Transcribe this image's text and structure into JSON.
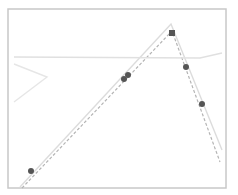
{
  "chart_data": {
    "type": "line",
    "title": "",
    "xlabel": "",
    "ylabel": "",
    "grid": false,
    "legend": null,
    "frame": {
      "x0": 8,
      "y0": 9,
      "x1": 226,
      "y1": 188,
      "color": "#c8c8c8"
    },
    "series": [
      {
        "name": "solid-path",
        "style": "solid",
        "color": "#dcdcdc",
        "points": [
          [
            20,
            187
          ],
          [
            171,
            24
          ],
          [
            222,
            150
          ]
        ]
      },
      {
        "name": "dashed-path",
        "style": "dashed",
        "color": "#b4b4b4",
        "points": [
          [
            22,
            188
          ],
          [
            172,
            31
          ],
          [
            220,
            162
          ]
        ]
      },
      {
        "name": "horizontal-line",
        "style": "solid",
        "color": "#e0e0e0",
        "points": [
          [
            14,
            57
          ],
          [
            200,
            58
          ],
          [
            222,
            53
          ]
        ]
      },
      {
        "name": "left-wedge",
        "style": "solid",
        "color": "#e6e6e6",
        "points": [
          [
            14,
            64
          ],
          [
            47,
            77
          ],
          [
            14,
            102
          ]
        ]
      }
    ],
    "markers": [
      {
        "shape": "square",
        "x": 172,
        "y": 33,
        "color": "#555555"
      },
      {
        "shape": "circle",
        "x": 31,
        "y": 171,
        "color": "#555555"
      },
      {
        "shape": "circle",
        "x": 124,
        "y": 79,
        "color": "#555555"
      },
      {
        "shape": "circle",
        "x": 128,
        "y": 75,
        "color": "#555555"
      },
      {
        "shape": "circle",
        "x": 186,
        "y": 67,
        "color": "#555555"
      },
      {
        "shape": "circle",
        "x": 202,
        "y": 104,
        "color": "#555555"
      }
    ]
  },
  "labels": {
    "chart": "Line plot with peak"
  }
}
